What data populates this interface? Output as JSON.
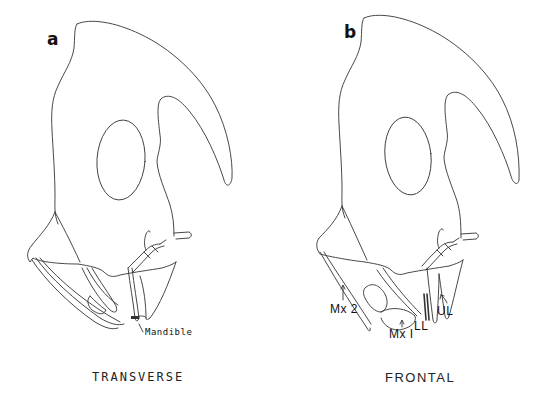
{
  "figure": {
    "panels": [
      {
        "id": "a",
        "letter": "a",
        "caption": "TRANSVERSE",
        "labels": [
          {
            "id": "mandible",
            "text": "Mandible"
          }
        ]
      },
      {
        "id": "b",
        "letter": "b",
        "caption": "FRONTAL",
        "labels": [
          {
            "id": "mx2",
            "text": "Mx 2"
          },
          {
            "id": "mx1",
            "text": "Mx I"
          },
          {
            "id": "ll",
            "text": "LL"
          },
          {
            "id": "ul",
            "text": "UL"
          }
        ]
      }
    ],
    "line_color": "#333333",
    "background": "#ffffff"
  }
}
